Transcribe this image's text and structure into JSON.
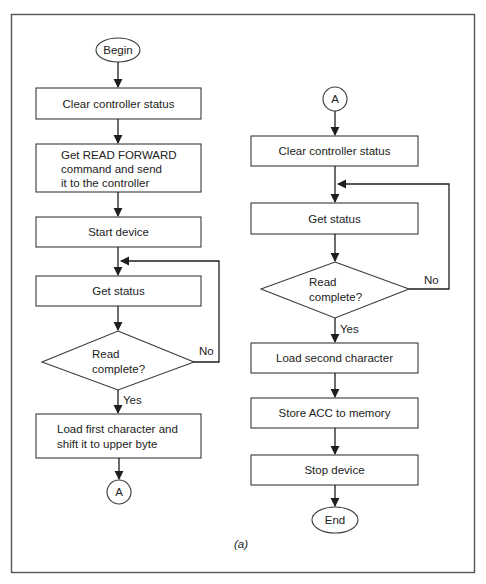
{
  "figure": {
    "caption": "(a)",
    "colors": {
      "stroke": "#3a3a3a",
      "text": "#222222",
      "background": "#ffffff",
      "frame": "#555555"
    }
  },
  "left_flow": {
    "start": "Begin",
    "steps": [
      {
        "id": "clear-status",
        "lines": [
          "Clear controller status"
        ]
      },
      {
        "id": "get-read-forward",
        "lines": [
          "Get READ FORWARD",
          "command and send",
          "it to the controller"
        ]
      },
      {
        "id": "start-device",
        "lines": [
          "Start device"
        ]
      },
      {
        "id": "get-status",
        "lines": [
          "Get status"
        ]
      }
    ],
    "decision": {
      "lines": [
        "Read",
        "complete?"
      ],
      "yes_label": "Yes",
      "no_label": "No"
    },
    "after_yes": {
      "id": "load-first-char",
      "lines": [
        "Load first character and",
        "shift it to upper byte"
      ]
    },
    "connector": "A"
  },
  "right_flow": {
    "connector": "A",
    "steps": [
      {
        "id": "clear-status",
        "lines": [
          "Clear controller status"
        ]
      },
      {
        "id": "get-status",
        "lines": [
          "Get status"
        ]
      }
    ],
    "decision": {
      "lines": [
        "Read",
        "complete?"
      ],
      "yes_label": "Yes",
      "no_label": "No"
    },
    "after_yes": [
      {
        "id": "load-second-char",
        "lines": [
          "Load second character"
        ]
      },
      {
        "id": "store-acc",
        "lines": [
          "Store ACC to memory"
        ]
      },
      {
        "id": "stop-device",
        "lines": [
          "Stop device"
        ]
      }
    ],
    "end": "End"
  }
}
